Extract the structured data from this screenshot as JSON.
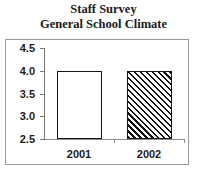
{
  "chart_data": {
    "type": "bar",
    "title": "Staff Survey",
    "subtitle": "General School Climate",
    "categories": [
      "2001",
      "2002"
    ],
    "values": [
      4.0,
      4.0
    ],
    "series": [
      {
        "name": "Rating",
        "values": [
          4.0,
          4.0
        ]
      }
    ],
    "xlabel": "",
    "ylabel": "",
    "ylim": [
      2.5,
      4.5
    ],
    "yticks": [
      "4.5",
      "4.0",
      "3.5",
      "3.0",
      "2.5"
    ],
    "ytick_values": [
      4.5,
      4.0,
      3.5,
      3.0,
      2.5
    ],
    "grid": false,
    "legend": "none",
    "bar_styles": [
      "solid-white-outline",
      "diagonal-hatch"
    ],
    "colors": {
      "bar_outline": "#141414",
      "bar_fill_2001": "#ffffff",
      "bar_hatch_2002": "#111111",
      "axis": "#767676",
      "frame_border": "#9a9a9a",
      "text": "#1c1c1c",
      "background": "#ffffff"
    }
  }
}
